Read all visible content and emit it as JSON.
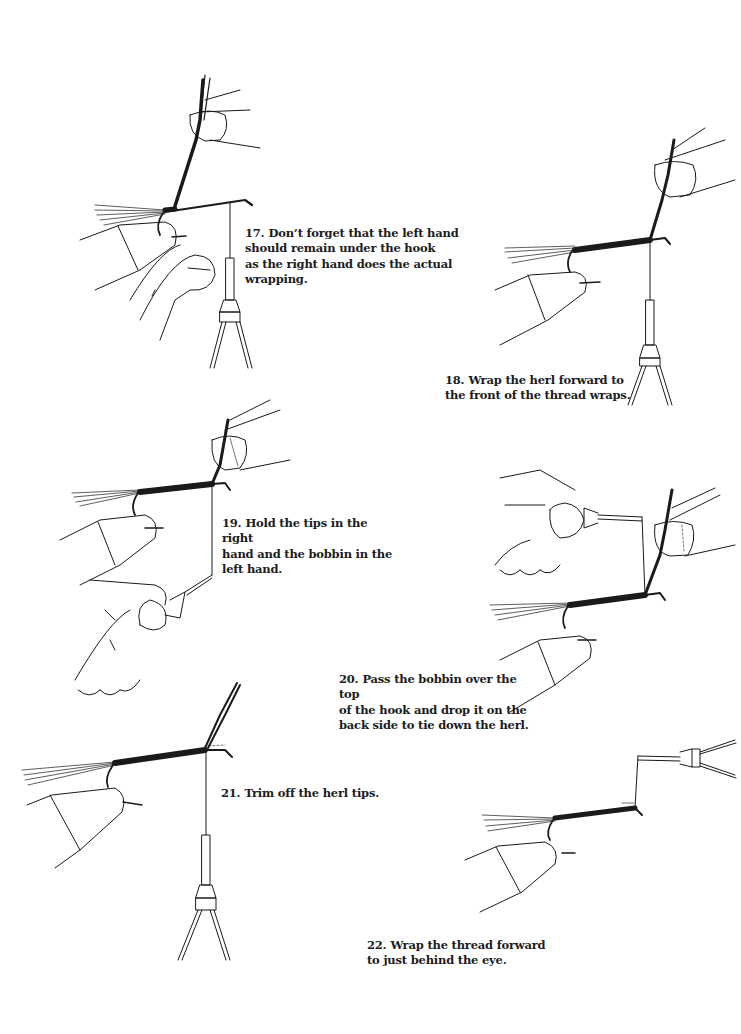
{
  "page": {
    "type": "instruction-illustration-page"
  },
  "steps": [
    {
      "number": "17.",
      "text": "Don’t forget that the left hand\nshould remain under the hook\nas the right hand does the actual\nwrapping."
    },
    {
      "number": "18.",
      "text": "Wrap the herl forward to\nthe front of the thread wraps."
    },
    {
      "number": "19.",
      "text": "Hold the tips in the right\nhand and the bobbin in the\nleft hand."
    },
    {
      "number": "20.",
      "text": "Pass the bobbin over the top\nof the hook and drop it on the\nback side to tie down the herl."
    },
    {
      "number": "21.",
      "text": "Trim off the herl tips."
    },
    {
      "number": "22.",
      "text": "Wrap the thread forward\nto just behind the eye."
    }
  ],
  "colors": {
    "ink": "#1a1a1a",
    "paper": "#ffffff"
  }
}
